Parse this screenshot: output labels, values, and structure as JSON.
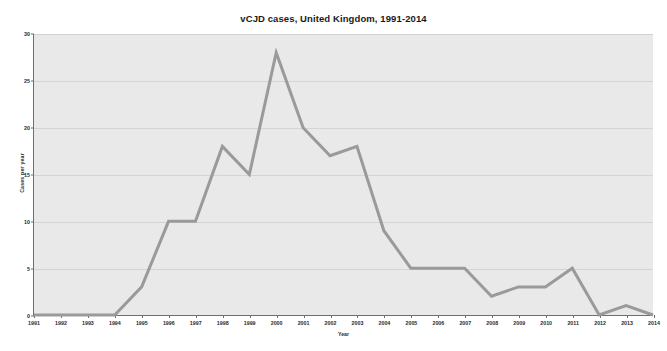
{
  "chart_data": {
    "type": "line",
    "title": "vCJD cases, United Kingdom, 1991-2014",
    "xlabel": "Year",
    "ylabel": "Cases per year",
    "categories": [
      "1991",
      "1992",
      "1993",
      "1994",
      "1995",
      "1996",
      "1997",
      "1998",
      "1999",
      "2000",
      "2001",
      "2002",
      "2003",
      "2004",
      "2005",
      "2006",
      "2007",
      "2008",
      "2009",
      "2010",
      "2011",
      "2012",
      "2013",
      "2014"
    ],
    "values": [
      0,
      0,
      0,
      0,
      3,
      10,
      10,
      18,
      15,
      28,
      20,
      17,
      18,
      9,
      5,
      5,
      5,
      2,
      3,
      3,
      5,
      0,
      1,
      0
    ],
    "x": [
      1991,
      1992,
      1993,
      1994,
      1995,
      1996,
      1997,
      1998,
      1999,
      2000,
      2001,
      2002,
      2003,
      2004,
      2005,
      2006,
      2007,
      2008,
      2009,
      2010,
      2011,
      2012,
      2013,
      2014
    ],
    "ylim": [
      0,
      30
    ],
    "xlim": [
      1991,
      2014
    ],
    "yticks": [
      0,
      5,
      10,
      15,
      20,
      25,
      30
    ],
    "ytick_labels": [
      "0",
      "5",
      "10",
      "15",
      "20",
      "25",
      "30"
    ],
    "grid": true,
    "grid_axis": "y",
    "legend": false,
    "legend_position": "none",
    "series_name": "vCJD cases",
    "markers": false
  },
  "style": {
    "line_color": "#9a9a9a",
    "line_width": 3,
    "plot_background": "#e9e9e9",
    "figure_background": "#ffffff",
    "gridline_color": "#d4d4d4",
    "axis_color": "#6e6e6e",
    "text_color": "#2a2a2a",
    "title_color": "#1a1a1a"
  }
}
